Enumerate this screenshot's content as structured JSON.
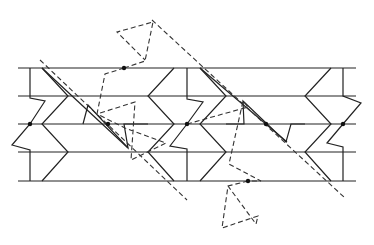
{
  "diagram": {
    "colors": {
      "line": "#222222",
      "dashed": "#333333",
      "background": "#ffffff"
    },
    "horizontal_lines_y": [
      68,
      96,
      124,
      152,
      181
    ],
    "strip_x_range": [
      18,
      356
    ],
    "dots": [
      {
        "x": 30,
        "y": 124
      },
      {
        "x": 124,
        "y": 68
      },
      {
        "x": 108,
        "y": 124
      },
      {
        "x": 187,
        "y": 124
      },
      {
        "x": 266,
        "y": 124
      },
      {
        "x": 248,
        "y": 181
      },
      {
        "x": 343,
        "y": 124
      }
    ]
  }
}
